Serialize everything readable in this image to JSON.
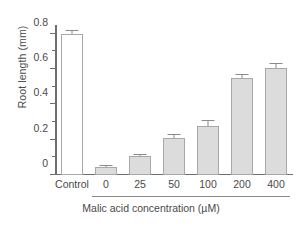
{
  "chart_data": {
    "type": "bar",
    "title": "",
    "xlabel": "Malic acid concentration (µM)",
    "ylabel": "Root length (mm)",
    "categories": [
      "Control",
      "0",
      "25",
      "50",
      "100",
      "200",
      "400"
    ],
    "values": [
      0.8,
      0.045,
      0.105,
      0.21,
      0.28,
      0.55,
      0.605
    ],
    "errors": [
      0.018,
      0.008,
      0.008,
      0.015,
      0.028,
      0.018,
      0.022
    ],
    "bar_styles": [
      "open",
      "filled",
      "filled",
      "filled",
      "filled",
      "filled",
      "filled"
    ],
    "ylim": [
      0,
      0.85
    ],
    "yticks": [
      0,
      0.2,
      0.4,
      0.6,
      0.8
    ],
    "ytick_labels": [
      "0",
      "0.2",
      "0.4",
      "0.6",
      "0.8"
    ],
    "yminor_ticks": [
      0.1,
      0.3,
      0.5,
      0.7
    ],
    "grid": false,
    "legend": null,
    "group_bracket": {
      "label": "Malic acid concentration (µM)",
      "covers": [
        "0",
        "25",
        "50",
        "100",
        "200",
        "400"
      ]
    },
    "colors": {
      "bar_fill": "#dcdcdc",
      "bar_edge": "#a8a8a8",
      "open_fill": "#ffffff",
      "axis": "#6e6e6e",
      "error": "#8a8a8a",
      "text": "#4a4a4a",
      "background": "#ffffff"
    }
  },
  "axis": {
    "y_title": "Root length (mm)",
    "x_title": "Malic acid concentration (µM)"
  }
}
